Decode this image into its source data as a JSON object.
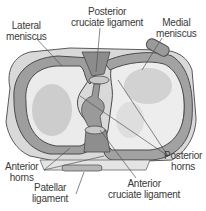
{
  "diagram": {
    "labels": {
      "lateral_meniscus": [
        "Lateral",
        "meniscus"
      ],
      "posterior_cruciate": [
        "Posterior",
        "cruciate ligament"
      ],
      "medial_meniscus": [
        "Medial",
        "meniscus"
      ],
      "anterior_horns": [
        "Anterior",
        "horns"
      ],
      "posterior_horns": [
        "Posterior",
        "horns"
      ],
      "patellar_ligament": [
        "Patellar",
        "ligament"
      ],
      "anterior_cruciate": [
        "Anterior",
        "cruciate ligament"
      ]
    },
    "colors": {
      "meniscus": "#9a9a9a",
      "outline": "#4a4a4a",
      "capsule": "#d6d6d6",
      "plateau": "#ececec",
      "cartilage": "#cfcfcf",
      "ligament": "#8c8c8c",
      "leader": "#555555"
    }
  }
}
